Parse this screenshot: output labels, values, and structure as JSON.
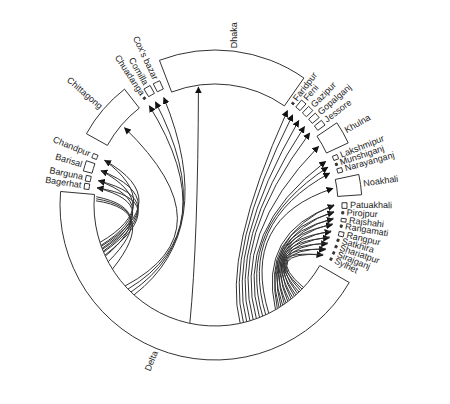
{
  "diagram": {
    "type": "circular flow (chord) diagram",
    "center": [
      215,
      205
    ],
    "outer_radius": 155,
    "inner_radius": 121,
    "stroke_color": "#333333",
    "arrow_color": "#111111",
    "nodes": [
      {
        "id": "delta",
        "label": "Delta",
        "start": 175,
        "end": 330,
        "size": "large",
        "side": "bottom"
      },
      {
        "id": "bagerhat",
        "label": "Bagerhat",
        "start": 173,
        "end": 170.5,
        "size": "thin"
      },
      {
        "id": "barguna",
        "label": "Barguna",
        "start": 169.5,
        "end": 167,
        "size": "thin"
      },
      {
        "id": "barisal",
        "label": "Barisal",
        "start": 165.5,
        "end": 161,
        "size": "small"
      },
      {
        "id": "chandpur",
        "label": "Chandpur",
        "start": 159,
        "end": 157,
        "size": "thin"
      },
      {
        "id": "chittagong",
        "label": "Chittagong",
        "start": 151,
        "end": 128,
        "size": "medium"
      },
      {
        "id": "chuadanga",
        "label": "Chuadanga",
        "start": 124,
        "end": 123,
        "size": "line"
      },
      {
        "id": "comilla",
        "label": "Comilla",
        "start": 121.5,
        "end": 118.5,
        "size": "small"
      },
      {
        "id": "coxs_bazar",
        "label": "Cox's bazar",
        "start": 117,
        "end": 114,
        "size": "small"
      },
      {
        "id": "dhaka",
        "label": "Dhaka",
        "start": 111,
        "end": 55,
        "size": "large"
      },
      {
        "id": "faridpur",
        "label": "Faridpur",
        "start": 53,
        "end": 52,
        "size": "line"
      },
      {
        "id": "feni",
        "label": "Feni",
        "start": 50.5,
        "end": 48,
        "size": "small"
      },
      {
        "id": "gazipur",
        "label": "Gazipur",
        "start": 46.5,
        "end": 44,
        "size": "small"
      },
      {
        "id": "gopalganj",
        "label": "Gopalganj",
        "start": 42.5,
        "end": 40,
        "size": "small"
      },
      {
        "id": "jessore",
        "label": "Jessore",
        "start": 38.5,
        "end": 36,
        "size": "small"
      },
      {
        "id": "khulna",
        "label": "Khulna",
        "start": 34,
        "end": 25,
        "size": "medium"
      },
      {
        "id": "lakshmipur",
        "label": "Lakshmipur",
        "start": 22.5,
        "end": 20.5,
        "size": "thin"
      },
      {
        "id": "munshiganj",
        "label": "Munshiganj",
        "start": 19,
        "end": 18,
        "size": "line"
      },
      {
        "id": "narayanganj",
        "label": "Narayanganj",
        "start": 16.5,
        "end": 14.5,
        "size": "thin"
      },
      {
        "id": "noakhali",
        "label": "Noakhali",
        "start": 12,
        "end": 4,
        "size": "medium"
      },
      {
        "id": "patuakhali",
        "label": "Patuakhali",
        "start": 1,
        "end": -1.5,
        "size": "thin"
      },
      {
        "id": "pirojpur",
        "label": "Pirojpur",
        "start": -3,
        "end": -4,
        "size": "line"
      },
      {
        "id": "rajshahi",
        "label": "Rajshahi",
        "start": -6,
        "end": -7.5,
        "size": "thin"
      },
      {
        "id": "rangamati",
        "label": "Rangamati",
        "start": -9,
        "end": -10,
        "size": "line"
      },
      {
        "id": "rangpur",
        "label": "Rangpur",
        "start": -12,
        "end": -14,
        "size": "thin"
      },
      {
        "id": "satkhira",
        "label": "Satkhira",
        "start": -15.5,
        "end": -16.5,
        "size": "line"
      },
      {
        "id": "shariatpur",
        "label": "Shariatpur",
        "start": -18.5,
        "end": -19.5,
        "size": "line"
      },
      {
        "id": "sirajganj",
        "label": "Sirajganj",
        "start": -21.5,
        "end": -22.5,
        "size": "line"
      },
      {
        "id": "sylhet",
        "label": "Sylhet",
        "start": -24.5,
        "end": -25.5,
        "size": "line"
      }
    ],
    "labels": {
      "delta": "Delta",
      "bagerhat": "Bagerhat",
      "barguna": "Barguna",
      "barisal": "Barisal",
      "chandpur": "Chandpur",
      "chittagong": "Chittagong",
      "chuadanga": "Chuadanga",
      "comilla": "Comilla",
      "coxs_bazar": "Cox's bazar",
      "dhaka": "Dhaka",
      "faridpur": "Faridpur",
      "feni": "Feni",
      "gazipur": "Gazipur",
      "gopalganj": "Gopalganj",
      "jessore": "Jessore",
      "khulna": "Khulna",
      "lakshmipur": "Lakshmipur",
      "munshiganj": "Munshiganj",
      "narayanganj": "Narayanganj",
      "noakhali": "Noakhali",
      "patuakhali": "Patuakhali",
      "pirojpur": "Pirojpur",
      "rajshahi": "Rajshahi",
      "rangamati": "Rangamati",
      "rangpur": "Rangpur",
      "satkhira": "Satkhira",
      "shariatpur": "Shariatpur",
      "sirajganj": "Sirajganj",
      "sylhet": "Sylhet"
    },
    "flows": {
      "source": "Delta",
      "left_fan_targets": [
        "Chandpur",
        "Barisal",
        "Barguna",
        "Bagerhat"
      ],
      "upper_left_targets": [
        "Chittagong",
        "Chuadanga",
        "Comilla",
        "Cox's bazar"
      ],
      "center_target": "Dhaka",
      "right_upper_targets": [
        "Faridpur",
        "Feni",
        "Gazipur",
        "Gopalganj",
        "Jessore",
        "Khulna",
        "Lakshmipur",
        "Munshiganj",
        "Narayanganj",
        "Noakhali"
      ],
      "right_lower_targets": [
        "Patuakhali",
        "Pirojpur",
        "Rajshahi",
        "Rangamati",
        "Rangpur",
        "Satkhira",
        "Shariatpur",
        "Sirajganj",
        "Sylhet"
      ]
    }
  }
}
